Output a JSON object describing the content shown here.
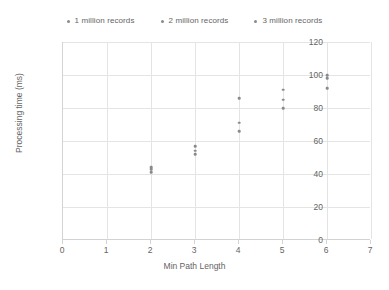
{
  "chart_data": {
    "type": "scatter",
    "title": "",
    "xlabel": "Min Path Length",
    "ylabel": "Processing time (ms)",
    "xlim": [
      0,
      7
    ],
    "ylim": [
      0,
      120
    ],
    "xticks": [
      "0",
      "1",
      "2",
      "3",
      "4",
      "5",
      "6",
      "7"
    ],
    "yticks": [
      "0",
      "20",
      "40",
      "60",
      "80",
      "100",
      "120"
    ],
    "grid": true,
    "legend_position": "top-center",
    "series": [
      {
        "name": "1 million records",
        "color": "#8a8a8a",
        "x": [
          2,
          3,
          4,
          5,
          6
        ],
        "y": [
          41,
          52,
          66,
          80,
          92
        ]
      },
      {
        "name": "2 million records",
        "color": "#8a8a8a",
        "x": [
          2,
          3,
          4,
          5,
          6
        ],
        "y": [
          43,
          54,
          71,
          85,
          98
        ]
      },
      {
        "name": "3 million records",
        "color": "#8a8a8a",
        "x": [
          2,
          3,
          4,
          5,
          6
        ],
        "y": [
          44,
          57,
          86,
          91,
          100
        ]
      }
    ]
  },
  "legend": {
    "entries": [
      {
        "label": "1 million records",
        "color": "#8a8a8a"
      },
      {
        "label": "2 million records",
        "color": "#8a8a8a"
      },
      {
        "label": "3 million records",
        "color": "#8a8a8a"
      }
    ]
  },
  "axes": {
    "x_title": "Min Path Length",
    "y_title": "Processing time (ms)",
    "x_tick_labels": [
      "0",
      "1",
      "2",
      "3",
      "4",
      "5",
      "6",
      "7"
    ],
    "y_tick_labels": [
      "0",
      "20",
      "40",
      "60",
      "80",
      "100",
      "120"
    ]
  },
  "colors": {
    "gridline": "#e4e4e4",
    "axis": "#d3d3d3",
    "text": "#646464",
    "marker": "#8a8a8a",
    "background": "#ffffff"
  }
}
